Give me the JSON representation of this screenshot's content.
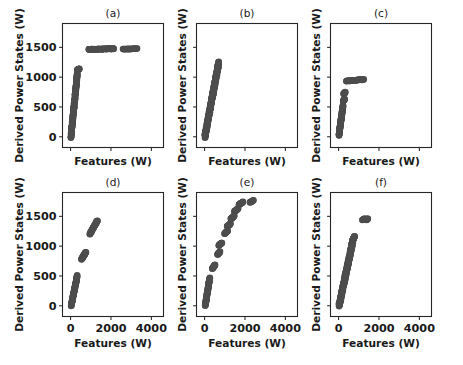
{
  "figure": {
    "width": 463,
    "height": 365,
    "background_color": "#ffffff",
    "marker_color": "#4d4d4d",
    "axis_color": "#262626",
    "rows": 2,
    "cols": 3
  },
  "axis_titles": {
    "x": "Features (W)",
    "y": "Derived Power States (W)"
  },
  "tick_labels": {
    "x": [
      "0",
      "2000",
      "4000"
    ],
    "y": [
      "0",
      "500",
      "1000",
      "1500"
    ]
  },
  "chart_data": {
    "type": "scatter",
    "title": "",
    "xlabel": "Features (W)",
    "ylabel": "Derived Power States (W)",
    "xlim": [
      -400,
      4600
    ],
    "ylim": [
      -180,
      1900
    ],
    "xticks": [
      0,
      2000,
      4000
    ],
    "yticks": [
      0,
      500,
      1000,
      1500
    ],
    "grid": false,
    "legend": null,
    "marker_color": "#4d4d4d",
    "marker_size": 7,
    "shared_x_ticklabels_rows": [
      "bottom"
    ],
    "shared_y_ticklabels_cols": [
      "left"
    ],
    "panels": [
      {
        "id": "a",
        "title": "(a)",
        "row": 0,
        "col": 0,
        "description": "Steep near-linear ramp from 0 to ~1050 over a narrow feature range, a short cluster near 1130, then a long plateau of points at ~1470 extending to high feature values.",
        "segments": [
          {
            "name": "ramp",
            "x_start": 20,
            "x_end": 330,
            "y_start": 0,
            "y_end": 1050,
            "n": 150
          },
          {
            "name": "step-1130",
            "x_start": 340,
            "x_end": 430,
            "y_start": 1120,
            "y_end": 1140,
            "n": 14
          },
          {
            "name": "plateau-1470",
            "x_start": 900,
            "x_end": 2150,
            "y_start": 1465,
            "y_end": 1478,
            "n": 60
          },
          {
            "name": "plateau-tail",
            "x_start": 2600,
            "x_end": 3300,
            "y_start": 1468,
            "y_end": 1480,
            "n": 18
          }
        ]
      },
      {
        "id": "b",
        "title": "(b)",
        "row": 0,
        "col": 1,
        "description": "A single dense, tight, near-linear band rising steeply from 0 to about 1250 with no plateau or outliers.",
        "segments": [
          {
            "name": "linear-band",
            "x_start": 15,
            "x_end": 700,
            "y_start": 0,
            "y_end": 1245,
            "n": 260
          }
        ]
      },
      {
        "id": "c",
        "title": "(c)",
        "row": 0,
        "col": 2,
        "description": "Steep ramp to ~520, two small intermediate clusters near 620 and 730, then a plateau at approximately 950 extending to moderate feature values.",
        "segments": [
          {
            "name": "ramp",
            "x_start": 20,
            "x_end": 220,
            "y_start": 30,
            "y_end": 520,
            "n": 90
          },
          {
            "name": "step-620",
            "x_start": 230,
            "x_end": 300,
            "y_start": 600,
            "y_end": 630,
            "n": 10
          },
          {
            "name": "step-730",
            "x_start": 250,
            "x_end": 330,
            "y_start": 720,
            "y_end": 745,
            "n": 10
          },
          {
            "name": "plateau-950",
            "x_start": 370,
            "x_end": 1250,
            "y_start": 935,
            "y_end": 960,
            "n": 34
          }
        ]
      },
      {
        "id": "d",
        "title": "(d)",
        "row": 1,
        "col": 0,
        "description": "Three separated diagonal cluster groups forming a broken staircase: a low group from 0 to ~500, a middle group near 780-900, and an upper group from ~1200 to ~1430.",
        "segments": [
          {
            "name": "cluster-low",
            "x_start": 30,
            "x_end": 330,
            "y_start": 0,
            "y_end": 500,
            "n": 70
          },
          {
            "name": "cluster-mid",
            "x_start": 540,
            "x_end": 760,
            "y_start": 780,
            "y_end": 900,
            "n": 28
          },
          {
            "name": "cluster-high",
            "x_start": 950,
            "x_end": 1330,
            "y_start": 1200,
            "y_end": 1430,
            "n": 42
          }
        ]
      },
      {
        "id": "e",
        "title": "(e)",
        "row": 1,
        "col": 1,
        "description": "A concave staircase of roughly nine to ten discrete clusters rising from 0 to about 1750, with the steps becoming flatter and more widely spaced in feature value toward the top.",
        "segments": [
          {
            "name": "base-ramp",
            "x_start": 30,
            "x_end": 260,
            "y_start": 0,
            "y_end": 470,
            "n": 70
          },
          {
            "name": "step-650",
            "x_start": 380,
            "x_end": 520,
            "y_start": 620,
            "y_end": 690,
            "n": 16
          },
          {
            "name": "step-880",
            "x_start": 640,
            "x_end": 760,
            "y_start": 860,
            "y_end": 905,
            "n": 14
          },
          {
            "name": "step-1030",
            "x_start": 700,
            "x_end": 860,
            "y_start": 1010,
            "y_end": 1055,
            "n": 14
          },
          {
            "name": "step-1230",
            "x_start": 990,
            "x_end": 1140,
            "y_start": 1210,
            "y_end": 1255,
            "n": 14
          },
          {
            "name": "step-1350",
            "x_start": 1120,
            "x_end": 1280,
            "y_start": 1330,
            "y_end": 1375,
            "n": 14
          },
          {
            "name": "step-1480",
            "x_start": 1300,
            "x_end": 1470,
            "y_start": 1455,
            "y_end": 1505,
            "n": 14
          },
          {
            "name": "step-1600",
            "x_start": 1480,
            "x_end": 1660,
            "y_start": 1580,
            "y_end": 1630,
            "n": 14
          },
          {
            "name": "step-1710",
            "x_start": 1700,
            "x_end": 1900,
            "y_start": 1695,
            "y_end": 1740,
            "n": 16
          },
          {
            "name": "step-1760-tail",
            "x_start": 2250,
            "x_end": 2420,
            "y_start": 1735,
            "y_end": 1765,
            "n": 10
          }
        ]
      },
      {
        "id": "f",
        "title": "(f)",
        "row": 1,
        "col": 2,
        "description": "A dense tight linear band rising from 0 to about 1150, plus two isolated small clusters at roughly 1450 in derived power at higher feature values.",
        "segments": [
          {
            "name": "linear-band",
            "x_start": 25,
            "x_end": 700,
            "y_start": 0,
            "y_end": 1080,
            "n": 230
          },
          {
            "name": "band-top",
            "x_start": 690,
            "x_end": 790,
            "y_start": 1090,
            "y_end": 1165,
            "n": 22
          },
          {
            "name": "outlier-left",
            "x_start": 1180,
            "x_end": 1290,
            "y_start": 1440,
            "y_end": 1460,
            "n": 8
          },
          {
            "name": "outlier-right",
            "x_start": 1380,
            "x_end": 1450,
            "y_start": 1440,
            "y_end": 1460,
            "n": 6
          }
        ]
      }
    ]
  }
}
